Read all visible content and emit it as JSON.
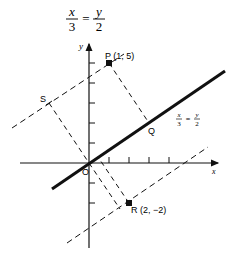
{
  "title": {
    "x_var": "x",
    "x_den": "3",
    "eq": "=",
    "y_var": "y",
    "y_den": "2"
  },
  "axes": {
    "x_label": "x",
    "y_label": "y",
    "origin_label": "O"
  },
  "line_label": {
    "x_var": "x",
    "x_den": "3",
    "eq": "=",
    "y_var": "y",
    "y_den": "2"
  },
  "points": {
    "P": "P (1, 5)",
    "Q": "Q",
    "R": "R (2, −2)",
    "S": "S"
  },
  "colors": {
    "ink": "#111111",
    "background": "#ffffff"
  }
}
